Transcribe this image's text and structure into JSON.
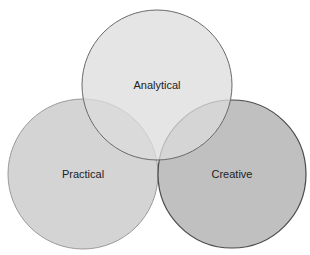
{
  "diagram": {
    "type": "venn",
    "sets": [
      {
        "id": "analytical",
        "label": "Analytical",
        "fill": "#dcdcdc",
        "stroke": "#6a6a6a",
        "cx": 157,
        "cy": 85,
        "r": 75
      },
      {
        "id": "practical",
        "label": "Practical",
        "fill": "#cfcfcf",
        "stroke": "#9a9a9a",
        "cx": 83,
        "cy": 174,
        "r": 75
      },
      {
        "id": "creative",
        "label": "Creative",
        "fill": "#bdbdbd",
        "stroke": "#4a4a4a",
        "cx": 232,
        "cy": 174,
        "r": 74
      }
    ]
  }
}
